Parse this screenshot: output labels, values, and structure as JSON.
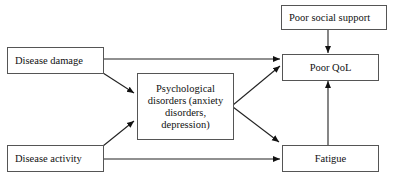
{
  "diagram": {
    "nodes": {
      "disease_damage": "Disease damage",
      "disease_activity": "Disease activity",
      "psychological": "Psychological disorders (anxiety disorders, depression)",
      "poor_social_support": "Poor social support",
      "poor_qol": "Poor QoL",
      "fatigue": "Fatigue"
    },
    "edges": [
      {
        "from": "Disease damage",
        "to": "Poor QoL"
      },
      {
        "from": "Disease damage",
        "to": "Psychological disorders (anxiety disorders, depression)"
      },
      {
        "from": "Disease activity",
        "to": "Psychological disorders (anxiety disorders, depression)"
      },
      {
        "from": "Disease activity",
        "to": "Fatigue"
      },
      {
        "from": "Psychological disorders (anxiety disorders, depression)",
        "to": "Poor QoL"
      },
      {
        "from": "Psychological disorders (anxiety disorders, depression)",
        "to": "Fatigue"
      },
      {
        "from": "Poor social support",
        "to": "Poor QoL"
      },
      {
        "from": "Fatigue",
        "to": "Poor QoL"
      }
    ]
  }
}
